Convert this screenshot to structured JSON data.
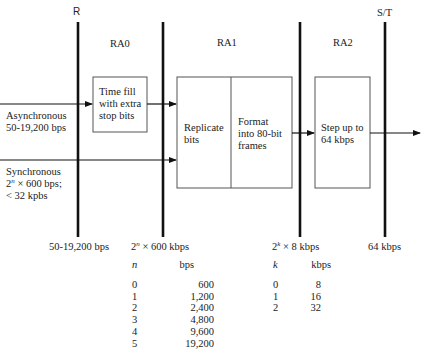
{
  "ref_points": {
    "r": "R",
    "st": "S/T"
  },
  "stages": {
    "ra0": "RA0",
    "ra1": "RA1",
    "ra2": "RA2"
  },
  "inputs": {
    "async_line1": "Asynchronous",
    "async_line2": "50-19,200 bps",
    "sync_line1": "Synchronous",
    "sync_line2_base": "2",
    "sync_line2_exp": "n",
    "sync_line2_rest": " × 600 bps;",
    "sync_line3": "< 32 kpbs"
  },
  "boxes": {
    "time_fill": [
      "Time fill",
      "with extra",
      "stop bits"
    ],
    "replicate": [
      "Replicate",
      "bits"
    ],
    "format": [
      "Format",
      "into 80-bit",
      "frames"
    ],
    "step_up": [
      "Step up to",
      "64 kbps"
    ]
  },
  "rates": {
    "r_rate": "50-19,200 bps",
    "ra1_rate_base": "2",
    "ra1_rate_exp": "n",
    "ra1_rate_rest": " × 600 kbps",
    "ra2_rate_base": "2",
    "ra2_rate_exp": "k",
    "ra2_rate_rest": " × 8 kbps",
    "st_rate": "64 kbps"
  },
  "table_n": {
    "header_var": "n",
    "header_unit": "bps",
    "rows": [
      {
        "n": "0",
        "bps": "600"
      },
      {
        "n": "1",
        "bps": "1,200"
      },
      {
        "n": "2",
        "bps": "2,400"
      },
      {
        "n": "3",
        "bps": "4,800"
      },
      {
        "n": "4",
        "bps": "9,600"
      },
      {
        "n": "5",
        "bps": "19,200"
      }
    ]
  },
  "table_k": {
    "header_var": "k",
    "header_unit": "kbps",
    "rows": [
      {
        "k": "0",
        "kbps": "8"
      },
      {
        "k": "1",
        "kbps": "16"
      },
      {
        "k": "2",
        "kbps": "32"
      }
    ]
  },
  "colors": {
    "line": "#111111",
    "box": "#555555",
    "text": "#222222"
  }
}
